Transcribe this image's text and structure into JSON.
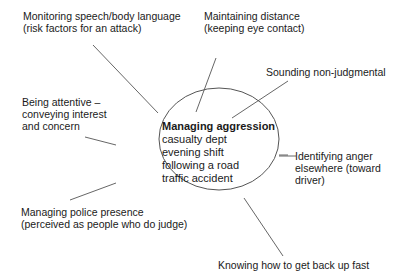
{
  "center": {
    "title": "Managing aggression",
    "lines": [
      "casualty dept",
      "evening shift",
      "following a road",
      "traffic accident"
    ]
  },
  "branches": [
    {
      "id": "monitoring",
      "lines": [
        "Monitoring speech/body language",
        "(risk factors for an attack)"
      ]
    },
    {
      "id": "distance",
      "lines": [
        "Maintaining distance",
        "(keeping eye contact)"
      ]
    },
    {
      "id": "non-judgmental",
      "lines": [
        "Sounding non-judgmental"
      ]
    },
    {
      "id": "attentive",
      "lines": [
        "Being attentive –",
        "conveying interest",
        "and concern"
      ]
    },
    {
      "id": "anger",
      "lines": [
        "Identifying anger",
        "elsewhere (toward",
        "driver)"
      ]
    },
    {
      "id": "police",
      "lines": [
        "Managing police presence",
        "(perceived as people who do judge)"
      ]
    },
    {
      "id": "back-up",
      "lines": [
        "Knowing how to get back up fast"
      ]
    }
  ],
  "colors": {
    "line": "#555555",
    "text": "#1a1a1a"
  }
}
